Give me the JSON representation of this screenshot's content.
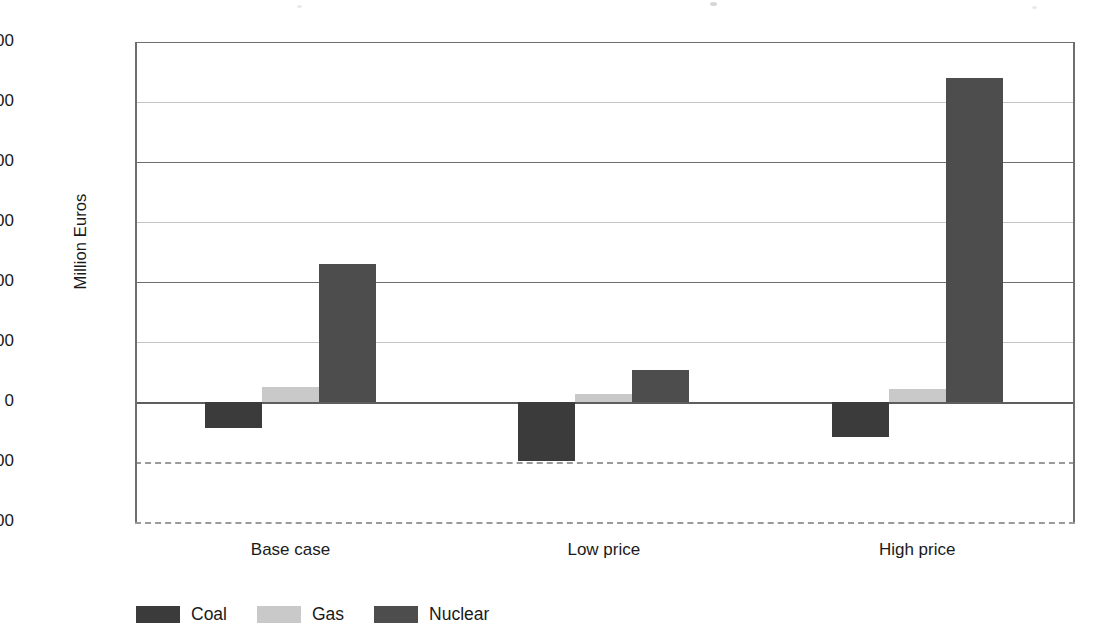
{
  "chart_data": {
    "type": "bar",
    "title": "",
    "subtitle": "",
    "xlabel": "",
    "ylabel": "Million Euros",
    "categories": [
      "Base case",
      "Low price",
      "High price"
    ],
    "series": [
      {
        "name": "Coal",
        "color": "#3b3b3b",
        "values": [
          -220,
          -490,
          -290
        ]
      },
      {
        "name": "Gas",
        "color": "#c9c9c9",
        "values": [
          125,
          70,
          105
        ]
      },
      {
        "name": "Nuclear",
        "color": "#4d4d4d",
        "values": [
          1150,
          265,
          2700
        ]
      }
    ],
    "ylim": [
      -1000,
      3000
    ],
    "y_ticks": [
      3000,
      2500,
      2000,
      1500,
      1000,
      500,
      0,
      -500,
      -1000
    ],
    "y_tick_labels": [
      "3 000",
      "2 500",
      "2 000",
      "1 500",
      "1 000",
      "500",
      "0",
      "-500",
      "-1 000"
    ],
    "gridline_styles": {
      "3000": "major",
      "2500": "minor",
      "2000": "major",
      "1500": "minor",
      "1000": "major",
      "500": "minor",
      "0": "zero",
      "-500": "dashed",
      "-1000": "dashed"
    },
    "grid": true,
    "legend_position": "bottom-left",
    "legend_entries": [
      "Coal",
      "Gas",
      "Nuclear"
    ]
  }
}
